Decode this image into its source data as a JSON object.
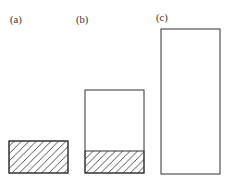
{
  "colors": {
    "background": "#ffffff",
    "stroke": "#333333",
    "hatch_stroke": "#3d3d3d"
  },
  "figure": {
    "width": 226,
    "height": 182,
    "baseline_y": 173,
    "bar_width": 59,
    "stroke_width": 1,
    "label_font_size": 10.5,
    "hatch": {
      "name": "diagonal-hatch",
      "direction": "/",
      "spacing": 7.4,
      "stroke_width": 0.9
    },
    "panels": [
      {
        "id": "a",
        "label": "(a)",
        "label_x": 10,
        "label_y": 23,
        "bar_x": 9,
        "bar_top": 141,
        "bar_height": 32,
        "hatched_height": 32
      },
      {
        "id": "b",
        "label": "(b)",
        "label_x": 76,
        "label_y": 23,
        "bar_x": 85,
        "bar_top": 90,
        "bar_height": 83,
        "hatched_height": 22
      },
      {
        "id": "c",
        "label": "(c)",
        "label_x": 156,
        "label_y": 21,
        "bar_x": 161,
        "bar_top": 29,
        "bar_height": 145,
        "hatched_height": 0
      }
    ]
  }
}
